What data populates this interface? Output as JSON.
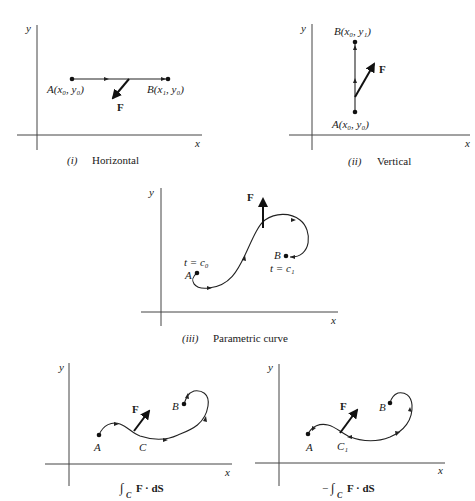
{
  "figure": {
    "panels": [
      {
        "id": "i",
        "caption_num": "(i)",
        "caption_text": "Horizontal",
        "axis_x": "x",
        "axis_y": "y",
        "point_a": "A(x₀, y₀)",
        "point_b": "B(x₁, y₀)",
        "force": "F"
      },
      {
        "id": "ii",
        "caption_num": "(ii)",
        "caption_text": "Vertical",
        "axis_x": "x",
        "axis_y": "y",
        "point_a": "A(x₀, y₀)",
        "point_b": "B(x₀, y₁)",
        "force": "F"
      },
      {
        "id": "iii",
        "caption_num": "(iii)",
        "caption_text": "Parametric curve",
        "axis_x": "x",
        "axis_y": "y",
        "point_a": "A",
        "point_b": "B",
        "t_start": "t = c₀",
        "t_end": "t = c₁",
        "force": "F"
      },
      {
        "id": "iv",
        "caption": "∫C F · dS",
        "caption_integral": "∫",
        "caption_sub": "C",
        "caption_body": "F · dS",
        "axis_x": "x",
        "axis_y": "y",
        "point_a": "A",
        "point_b": "B",
        "curve_label": "C",
        "force": "F"
      },
      {
        "id": "v",
        "caption": "−∫C F · dS",
        "caption_minus": "−",
        "caption_integral": "∫",
        "caption_sub": "C",
        "caption_body": "F · dS",
        "axis_x": "x",
        "axis_y": "y",
        "point_a": "A",
        "point_b": "B",
        "curve_label": "C₁",
        "force": "F"
      }
    ]
  }
}
